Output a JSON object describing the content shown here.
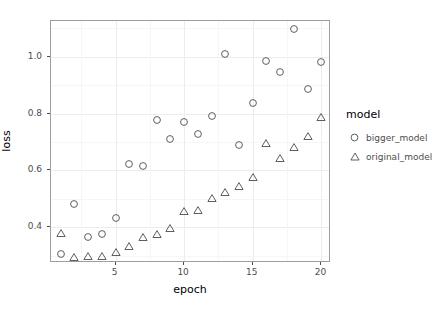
{
  "chart_data": {
    "type": "scatter",
    "title": "",
    "xlabel": "epoch",
    "ylabel": "loss",
    "xlim": [
      0.3,
      20.7
    ],
    "ylim": [
      0.275,
      1.125
    ],
    "xticks": [
      5,
      10,
      15,
      20
    ],
    "xtick_labels": [
      "5",
      "10",
      "15",
      "20"
    ],
    "yticks": [
      0.4,
      0.6,
      0.8,
      1.0
    ],
    "ytick_labels": [
      "0.4",
      "0.6",
      "0.8",
      "1.0"
    ],
    "grid": true,
    "legend_position": "right",
    "legend_title": "model",
    "x": [
      1,
      2,
      3,
      4,
      5,
      6,
      7,
      8,
      9,
      10,
      11,
      12,
      13,
      14,
      15,
      16,
      17,
      18,
      19,
      20
    ],
    "series": [
      {
        "name": "bigger_model",
        "marker": "circle",
        "color": "#4d4d4d",
        "values": [
          0.305,
          0.481,
          0.368,
          0.376,
          0.434,
          0.623,
          0.616,
          0.778,
          0.711,
          0.77,
          0.729,
          0.791,
          1.01,
          0.691,
          0.836,
          0.985,
          0.945,
          1.096,
          0.887,
          0.982
        ]
      },
      {
        "name": "original_model",
        "marker": "triangle",
        "color": "#4d4d4d",
        "values": [
          0.381,
          0.296,
          0.3,
          0.3,
          0.315,
          0.334,
          0.366,
          0.377,
          0.399,
          0.457,
          0.462,
          0.505,
          0.523,
          0.546,
          0.578,
          0.698,
          0.645,
          0.682,
          0.722,
          0.788
        ]
      }
    ]
  },
  "legend": {
    "title": "model",
    "entries": [
      {
        "label": "bigger_model",
        "marker": "circle"
      },
      {
        "label": "original_model",
        "marker": "triangle"
      }
    ]
  },
  "axes": {
    "x_title": "epoch",
    "y_title": "loss"
  },
  "colors": {
    "panel_border": "#9e9e9e",
    "grid_major": "#ececec",
    "grid_minor": "#f6f6f6",
    "text": "#4d4d4d",
    "title_text": "#000000",
    "background": "#ffffff"
  }
}
